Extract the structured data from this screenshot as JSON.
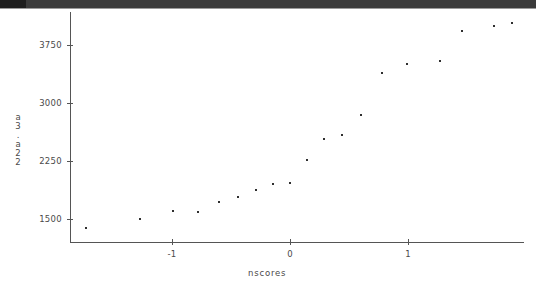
{
  "window": {
    "titlebar_present": true,
    "titlebar_color": "#3b3b3b"
  },
  "chart_data": {
    "type": "scatter",
    "title": "",
    "subtitle": "",
    "xlabel": "nscores",
    "ylabel": "a3.a22",
    "ylabel_chars": [
      "a",
      "3",
      ".",
      "a",
      "2",
      "2"
    ],
    "xticks": [
      -1,
      0,
      1
    ],
    "xticklabels": [
      "-1",
      "0",
      "1"
    ],
    "yticks": [
      1500,
      2250,
      3000,
      3750
    ],
    "yticklabels": [
      "1500",
      "2250",
      "3000",
      "3750"
    ],
    "xlim": [
      -1.85,
      1.95
    ],
    "ylim": [
      1330,
      4180
    ],
    "grid": false,
    "legend": null,
    "marker": "point",
    "marker_color": "#2f2f2f",
    "points": [
      {
        "x": -1.73,
        "y": 1380
      },
      {
        "x": -1.27,
        "y": 1500
      },
      {
        "x": -0.99,
        "y": 1600
      },
      {
        "x": -0.78,
        "y": 1590
      },
      {
        "x": -0.6,
        "y": 1720
      },
      {
        "x": -0.44,
        "y": 1790
      },
      {
        "x": -0.29,
        "y": 1870
      },
      {
        "x": -0.14,
        "y": 1950
      },
      {
        "x": 0.0,
        "y": 1970
      },
      {
        "x": 0.14,
        "y": 2260
      },
      {
        "x": 0.29,
        "y": 2530
      },
      {
        "x": 0.44,
        "y": 2580
      },
      {
        "x": 0.6,
        "y": 2840
      },
      {
        "x": 0.78,
        "y": 3390
      },
      {
        "x": 0.99,
        "y": 3500
      },
      {
        "x": 1.27,
        "y": 3540
      },
      {
        "x": 1.46,
        "y": 3930
      },
      {
        "x": 1.73,
        "y": 3990
      },
      {
        "x": 1.88,
        "y": 4040
      }
    ]
  }
}
